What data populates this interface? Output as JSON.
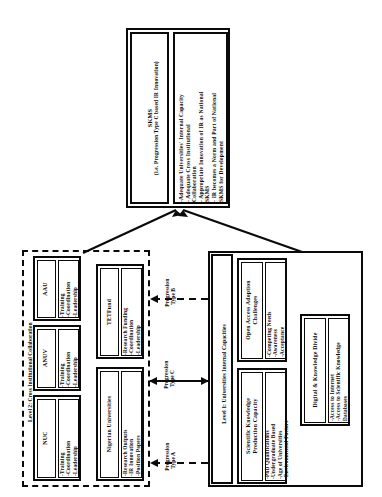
{
  "diagram": {
    "title_hidden": "",
    "top_node": {
      "name": "skms-node",
      "header_line1": "SKMS",
      "header_line2": "(i.e. Progression Type C based IR Innovation)",
      "bullets": "-Adequate Universities' Internal Capacity\n- Adequate Cross Institutional\nCollaboration\n- Appropriate Innovation of IR as National\nSKMS\n- IR becomes a Norm and Part of National\nSKMS for Development"
    },
    "level2": {
      "name": "level-2-group",
      "label": "Level 2: Cross Institutional Collaboration",
      "nodes": [
        {
          "title": "NUC",
          "items": "-Training\n-Coordination\n-Leadership"
        },
        {
          "title": "ANUV",
          "items": "-Training\n-Coordination\n-Leadership"
        },
        {
          "title": "AAU",
          "items": "-Training\n-Coordination\n-Leadership"
        },
        {
          "title": "Nigerian Universities",
          "items": "-Research Outputs\n-IR Innovation\n-Position Papers"
        },
        {
          "title": "TETFund",
          "items": "-Research Funding\n-Coordination\n-Leadership"
        }
      ]
    },
    "level1": {
      "name": "level-1-group",
      "label": "Level 1: Universities Internal Capacities",
      "nodes": [
        {
          "title": "Open Access Adoption\nChallenges",
          "items": "-Competing Needs\n-Awareness\n-Acceptance"
        },
        {
          "title": "Scientific Knowledge\nProduction Capacity",
          "items": "-PhD Qualifications\n-Undergraduate Based\n-Age of Universities\n-Environmental Factors"
        },
        {
          "title": "Digital & Knowledge Divide",
          "items": "-Access to Internet\n-Access to Scientific Knowledge\nDatabases"
        }
      ]
    },
    "progressions": [
      {
        "name": "progression-type-a",
        "label": "Progression\nType A"
      },
      {
        "name": "progression-type-c",
        "label": "Progression\nType C"
      },
      {
        "name": "progression-type-b",
        "label": "Progression\nType B"
      }
    ],
    "colors": {
      "stroke": "#0a0a0a",
      "background": "#ffffff"
    }
  }
}
